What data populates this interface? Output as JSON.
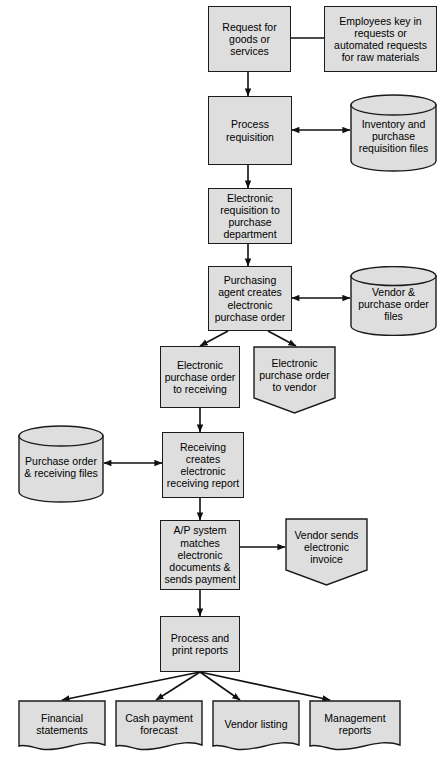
{
  "diagram": {
    "fill_color": "#dedede",
    "stroke_color": "#1a1a1a",
    "nodes": [
      {
        "id": "request",
        "shape": "rect",
        "label": "Request for goods or services"
      },
      {
        "id": "employees",
        "shape": "rect",
        "label": "Employees key in requests or automated requests for raw materials"
      },
      {
        "id": "process_req",
        "shape": "rect",
        "label": "Process requisition"
      },
      {
        "id": "inventory_file",
        "shape": "cylinder",
        "label": "Inventory and purchase requisition files"
      },
      {
        "id": "elec_req",
        "shape": "rect",
        "label": "Electronic requisition to purchase department"
      },
      {
        "id": "purch_agent",
        "shape": "rect",
        "label": "Purchasing agent creates electronic purchase order"
      },
      {
        "id": "vendor_file",
        "shape": "cylinder",
        "label": "Vendor & purchase order files"
      },
      {
        "id": "po_receiving",
        "shape": "rect",
        "label": "Electronic purchase order to receiving"
      },
      {
        "id": "po_vendor",
        "shape": "document",
        "label": "Electronic purchase order to vendor"
      },
      {
        "id": "po_rec_file",
        "shape": "cylinder",
        "label": "Purchase order & receiving files"
      },
      {
        "id": "receiving",
        "shape": "rect",
        "label": "Receiving creates electronic receiving report"
      },
      {
        "id": "ap_system",
        "shape": "rect",
        "label": "A/P system matches electronic documents & sends payment"
      },
      {
        "id": "vendor_invoice",
        "shape": "document",
        "label": "Vendor sends electronic invoice"
      },
      {
        "id": "print_reports",
        "shape": "rect",
        "label": "Process and print reports"
      },
      {
        "id": "financial",
        "shape": "report",
        "label": "Financial statements"
      },
      {
        "id": "cash",
        "shape": "report",
        "label": "Cash payment forecast"
      },
      {
        "id": "vendor_listing",
        "shape": "report",
        "label": "Vendor listing"
      },
      {
        "id": "mgmt",
        "shape": "report",
        "label": "Management reports"
      }
    ],
    "connectors": [
      {
        "from": "request",
        "to": "employees",
        "type": "line"
      },
      {
        "from": "request",
        "to": "process_req",
        "type": "arrow"
      },
      {
        "from": "process_req",
        "to": "inventory_file",
        "type": "double-arrow"
      },
      {
        "from": "process_req",
        "to": "elec_req",
        "type": "arrow"
      },
      {
        "from": "elec_req",
        "to": "purch_agent",
        "type": "arrow"
      },
      {
        "from": "purch_agent",
        "to": "vendor_file",
        "type": "double-arrow"
      },
      {
        "from": "purch_agent",
        "to": "po_receiving",
        "type": "arrow"
      },
      {
        "from": "purch_agent",
        "to": "po_vendor",
        "type": "arrow"
      },
      {
        "from": "po_receiving",
        "to": "receiving",
        "type": "arrow"
      },
      {
        "from": "po_rec_file",
        "to": "receiving",
        "type": "double-arrow"
      },
      {
        "from": "receiving",
        "to": "ap_system",
        "type": "arrow"
      },
      {
        "from": "ap_system",
        "to": "vendor_invoice",
        "type": "arrow"
      },
      {
        "from": "ap_system",
        "to": "print_reports",
        "type": "arrow"
      },
      {
        "from": "print_reports",
        "to": "financial",
        "type": "arrow"
      },
      {
        "from": "print_reports",
        "to": "cash",
        "type": "arrow"
      },
      {
        "from": "print_reports",
        "to": "vendor_listing",
        "type": "arrow"
      },
      {
        "from": "print_reports",
        "to": "mgmt",
        "type": "arrow"
      }
    ]
  }
}
